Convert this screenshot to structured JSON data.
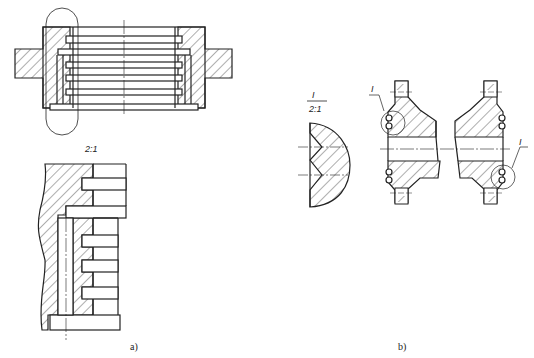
{
  "figure_a": {
    "scale_label": "2:1",
    "caption": "a)"
  },
  "figure_b": {
    "detail_label": "I",
    "detail_scale": "2:1",
    "callout_left": "I",
    "callout_right": "I",
    "caption": "b)"
  },
  "colors": {
    "line": "#222222",
    "background": "#ffffff"
  }
}
